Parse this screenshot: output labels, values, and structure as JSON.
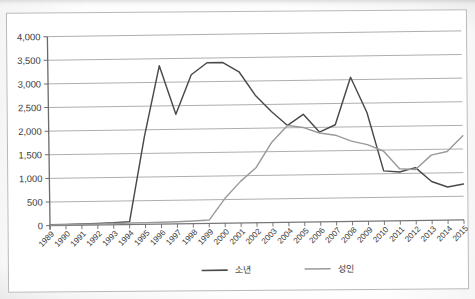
{
  "chart_data": {
    "type": "line",
    "title": "",
    "xlabel": "",
    "ylabel": "",
    "ylim": [
      0,
      4000
    ],
    "ytick_step": 500,
    "grid": true,
    "legend_position": "bottom-center",
    "x": [
      1989,
      1990,
      1991,
      1992,
      1993,
      1994,
      1995,
      1996,
      1997,
      1998,
      1999,
      2000,
      2001,
      2002,
      2003,
      2004,
      2005,
      2006,
      2007,
      2008,
      2009,
      2010,
      2011,
      2012,
      2013,
      2014,
      2015
    ],
    "categories": [
      "1989",
      "1990",
      "1991",
      "1992",
      "1993",
      "1994",
      "1995",
      "1996",
      "1997",
      "1998",
      "1999",
      "2000",
      "2001",
      "2002",
      "2003",
      "2004",
      "2005",
      "2006",
      "2007",
      "2008",
      "2009",
      "2010",
      "2011",
      "2012",
      "2013",
      "2014",
      "2015"
    ],
    "ytick_labels": [
      "0",
      "500",
      "1,000",
      "1,500",
      "2,000",
      "2,500",
      "3,000",
      "3,500",
      "4,000"
    ],
    "ytick_values": [
      0,
      500,
      1000,
      1500,
      2000,
      2500,
      3000,
      3500,
      4000
    ],
    "series": [
      {
        "name": "소년",
        "color": "#4a4a4a",
        "values": [
          20,
          20,
          25,
          30,
          40,
          60,
          1850,
          3350,
          2320,
          3150,
          3400,
          3400,
          3200,
          2700,
          2350,
          2050,
          2280,
          1900,
          2050,
          3050,
          2300,
          1060,
          1030,
          1120,
          820,
          700,
          760
        ]
      },
      {
        "name": "성인",
        "color": "#9a9a9a",
        "values": [
          15,
          15,
          18,
          20,
          25,
          30,
          35,
          40,
          45,
          55,
          70,
          520,
          880,
          1170,
          1700,
          2050,
          2000,
          1880,
          1830,
          1700,
          1620,
          1480,
          1100,
          1080,
          1380,
          1450,
          1780
        ]
      }
    ]
  },
  "legend": {
    "items": [
      {
        "label": "소년"
      },
      {
        "label": "성인"
      }
    ]
  }
}
